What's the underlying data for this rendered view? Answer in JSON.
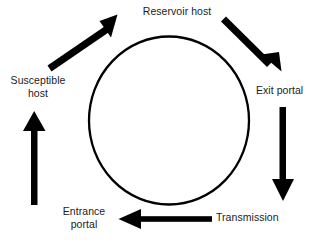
{
  "diagram": {
    "type": "cycle-diagram",
    "background_color": "#ffffff",
    "stroke_color": "#000000",
    "text_color": "#1c1c1c",
    "center_shape": {
      "name": "central-circle",
      "shape": "circle",
      "cx": 169,
      "cy": 120.5,
      "rx": 80,
      "ry": 84,
      "stroke_width": 2.2,
      "fill": "none"
    },
    "nodes": [
      {
        "id": "reservoir-host",
        "label": "Reservoir host",
        "position": "top"
      },
      {
        "id": "exit-portal",
        "label": "Exit portal",
        "position": "right"
      },
      {
        "id": "transmission",
        "label": "Transmission",
        "position": "bottom-right"
      },
      {
        "id": "entrance-portal",
        "label": "Entrance\nportal",
        "position": "bottom-left"
      },
      {
        "id": "susceptible-host",
        "label": "Susceptible\nhost",
        "position": "left"
      }
    ],
    "arrows": [
      {
        "id": "arrow-susceptible-to-reservoir",
        "from": "susceptible-host",
        "to": "reservoir-host",
        "direction": "up-right",
        "x1": 48,
        "y1": 63,
        "x2": 114,
        "y2": 18,
        "shaft_width": 6.5
      },
      {
        "id": "arrow-reservoir-to-exit",
        "from": "reservoir-host",
        "to": "exit-portal",
        "direction": "down-right",
        "x1": 228,
        "y1": 20,
        "x2": 279,
        "y2": 69,
        "shaft_width": 6.5
      },
      {
        "id": "arrow-exit-to-transmission",
        "from": "exit-portal",
        "to": "transmission",
        "direction": "down",
        "x1": 283,
        "y1": 108,
        "x2": 283,
        "y2": 200,
        "shaft_width": 6.5
      },
      {
        "id": "arrow-transmission-to-entrance",
        "from": "transmission",
        "to": "entrance-portal",
        "direction": "left",
        "x1": 211,
        "y1": 219,
        "x2": 119,
        "y2": 219,
        "shaft_width": 6.0
      },
      {
        "id": "arrow-entrance-to-susceptible",
        "from": "entrance-portal",
        "to": "susceptible-host",
        "direction": "up",
        "x1": 34,
        "y1": 205,
        "x2": 34,
        "y2": 112,
        "shaft_width": 6.5
      }
    ]
  }
}
